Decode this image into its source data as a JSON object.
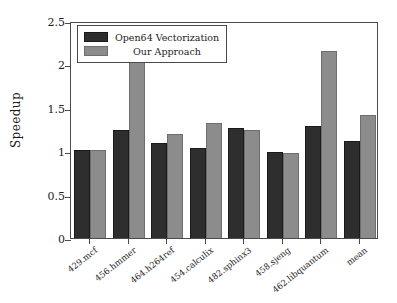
{
  "chart_data": {
    "type": "bar",
    "title": "",
    "xlabel": "",
    "ylabel": "Speedup",
    "ylim": [
      0,
      2.5
    ],
    "yticks": [
      "0",
      "0.5",
      "1",
      "1.5",
      "2",
      "2.5"
    ],
    "ytick_values": [
      0,
      0.5,
      1,
      1.5,
      2,
      2.5
    ],
    "grid": false,
    "legend_position": "upper left",
    "categories": [
      "429.mcf",
      "456.hmmer",
      "464.h264ref",
      "454.calculix",
      "482.sphinx3",
      "458.sjeng",
      "462.libquantum",
      "mean"
    ],
    "series": [
      {
        "name": "Open64 Vectorization",
        "color": "#2e2e2e",
        "values": [
          1.01,
          1.25,
          1.1,
          1.04,
          1.27,
          0.99,
          1.29,
          1.12
        ]
      },
      {
        "name": "Our Approach",
        "color": "#8c8c8c",
        "values": [
          1.01,
          2.04,
          1.2,
          1.33,
          1.24,
          0.98,
          2.15,
          1.42
        ]
      }
    ]
  },
  "axis": {
    "y_label": "Speedup"
  },
  "legend": {
    "entries": [
      {
        "label": "Open64 Vectorization"
      },
      {
        "label": "Our Approach"
      }
    ]
  }
}
